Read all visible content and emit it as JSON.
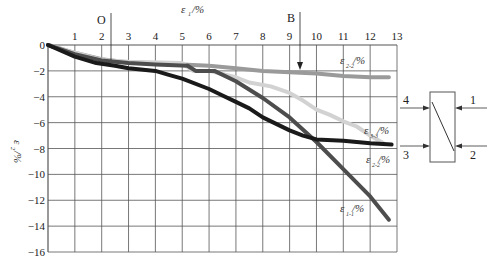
{
  "chart_data": {
    "type": "line",
    "title": "",
    "xlabel": "ε1/%",
    "ylabel": "ε2/%",
    "xlim": [
      0,
      13
    ],
    "ylim": [
      -16,
      0
    ],
    "x_ticks": [
      1,
      2,
      3,
      4,
      5,
      6,
      7,
      8,
      9,
      10,
      11,
      12,
      13
    ],
    "y_ticks": [
      0,
      -2,
      -4,
      -6,
      -8,
      -10,
      -12,
      -14,
      -16
    ],
    "grid": true,
    "annotations": [
      {
        "text": "O",
        "x": 2.5,
        "type": "vertical-marker"
      },
      {
        "text": "B",
        "x": 9.6,
        "type": "arrow-down"
      }
    ],
    "series": [
      {
        "name": "ε2-2/%",
        "color": "#9a9a9a",
        "width": 4,
        "points": [
          [
            0,
            0
          ],
          [
            1,
            -0.6
          ],
          [
            2,
            -1.1
          ],
          [
            3,
            -1.35
          ],
          [
            4,
            -1.45
          ],
          [
            5,
            -1.5
          ],
          [
            6,
            -1.6
          ],
          [
            7,
            -1.8
          ],
          [
            8,
            -2.0
          ],
          [
            9,
            -2.1
          ],
          [
            10,
            -2.2
          ],
          [
            11,
            -2.4
          ],
          [
            12,
            -2.5
          ],
          [
            12.7,
            -2.5
          ]
        ]
      },
      {
        "name": "ε3-3/%",
        "color": "#d2d2d2",
        "width": 4,
        "points": [
          [
            0,
            0
          ],
          [
            1,
            -0.6
          ],
          [
            2,
            -1.15
          ],
          [
            3,
            -1.3
          ],
          [
            5,
            -1.4
          ],
          [
            5.4,
            -2.0
          ],
          [
            6,
            -2.0
          ],
          [
            7,
            -2.5
          ],
          [
            7.5,
            -2.9
          ],
          [
            8.3,
            -3.2
          ],
          [
            9,
            -3.7
          ],
          [
            9.5,
            -4.3
          ],
          [
            10,
            -5.0
          ],
          [
            10.5,
            -5.4
          ],
          [
            11,
            -5.9
          ],
          [
            11.5,
            -6.3
          ],
          [
            12,
            -7.0
          ],
          [
            12.5,
            -7.6
          ]
        ]
      },
      {
        "name": "ε1-1/%",
        "color": "#4d4d4d",
        "width": 4,
        "points": [
          [
            0,
            0
          ],
          [
            1,
            -0.7
          ],
          [
            2,
            -1.2
          ],
          [
            3,
            -1.4
          ],
          [
            4,
            -1.5
          ],
          [
            5.2,
            -1.6
          ],
          [
            5.5,
            -2.0
          ],
          [
            6.2,
            -2.0
          ],
          [
            7,
            -2.8
          ],
          [
            8,
            -4.1
          ],
          [
            9,
            -5.6
          ],
          [
            10,
            -7.5
          ],
          [
            11,
            -9.6
          ],
          [
            12,
            -11.7
          ],
          [
            12.7,
            -13.5
          ]
        ]
      },
      {
        "name": "ε3-3 (black)",
        "color": "#1a1a1a",
        "width": 4,
        "points": [
          [
            0,
            0
          ],
          [
            1,
            -0.9
          ],
          [
            1.8,
            -1.4
          ],
          [
            2.5,
            -1.6
          ],
          [
            3,
            -1.8
          ],
          [
            4,
            -2.0
          ],
          [
            4.5,
            -2.3
          ],
          [
            5,
            -2.6
          ],
          [
            6,
            -3.4
          ],
          [
            6.5,
            -3.9
          ],
          [
            7,
            -4.4
          ],
          [
            7.5,
            -4.9
          ],
          [
            8,
            -5.6
          ],
          [
            8.5,
            -6.1
          ],
          [
            9,
            -6.6
          ],
          [
            9.5,
            -7.0
          ],
          [
            10,
            -7.3
          ],
          [
            11,
            -7.4
          ],
          [
            12,
            -7.6
          ],
          [
            12.8,
            -7.7
          ]
        ]
      }
    ],
    "series_labels": [
      {
        "text": "ε",
        "sub": "2-2",
        "unit": "/%",
        "x": 11.2,
        "y": -1.8
      },
      {
        "text": "ε",
        "sub": "3-3",
        "unit": "/%",
        "x": 12.1,
        "y": -7.0
      },
      {
        "text": "ε",
        "sub": "2-2",
        "unit": "/%",
        "x": 12.2,
        "y": -9.0
      },
      {
        "text": "ε",
        "sub": "1-1",
        "unit": "/%",
        "x": 10.9,
        "y": -12.8
      }
    ]
  },
  "axis": {
    "x_title": "ε",
    "x_title_sub": "1",
    "x_title_unit": "/%",
    "y_title": "ε",
    "y_title_sub": "2",
    "y_title_unit": "/%",
    "marker_o": "O",
    "marker_b": "B",
    "x_ticks": [
      "1",
      "2",
      "3",
      "4",
      "5",
      "6",
      "7",
      "8",
      "9",
      "10",
      "11",
      "12",
      "13"
    ],
    "y_ticks": [
      "0",
      "−2",
      "−4",
      "−6",
      "−8",
      "−10",
      "−12",
      "−14",
      "−16"
    ]
  },
  "labels": {
    "l1": {
      "main": "ε",
      "sub": "2-2",
      "unit": "/%"
    },
    "l2": {
      "main": "ε",
      "sub": "3-3",
      "unit": "/%"
    },
    "l3": {
      "main": "ε",
      "sub": "2-2",
      "unit": "/%"
    },
    "l4": {
      "main": "ε",
      "sub": "1-1",
      "unit": "/%"
    }
  },
  "diagram": {
    "n1": "1",
    "n2": "2",
    "n3": "3",
    "n4": "4"
  }
}
